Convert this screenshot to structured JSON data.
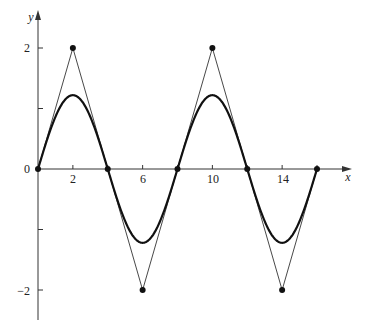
{
  "chart_data": {
    "type": "line",
    "title": "",
    "xlabel": "x",
    "ylabel": "y",
    "x_ticks": [
      2,
      6,
      10,
      14
    ],
    "x_ticks_unlabeled": [
      4,
      8,
      12,
      16
    ],
    "y_ticks": [
      2,
      0,
      -2
    ],
    "y_ticks_unlabeled": [
      1,
      -1
    ],
    "xlim": [
      0,
      18
    ],
    "ylim": [
      -2.5,
      2.5
    ],
    "grid": false,
    "legend": null,
    "series": [
      {
        "name": "triangle wave (piecewise linear)",
        "style": "thin",
        "x": [
          0,
          2,
          4,
          6,
          8,
          10,
          12,
          14,
          16
        ],
        "y": [
          0,
          2,
          0,
          -2,
          0,
          2,
          0,
          -2,
          0
        ]
      },
      {
        "name": "sine approximation",
        "style": "thick",
        "function": "A*sin(pi*x/4)",
        "amplitude": 1.22,
        "x_range": [
          0,
          16
        ]
      },
      {
        "name": "marked points",
        "style": "dots",
        "x": [
          0,
          2,
          4,
          6,
          8,
          10,
          12,
          14,
          16
        ],
        "y": [
          0,
          2,
          0,
          -2,
          0,
          2,
          0,
          -2,
          0
        ]
      }
    ]
  },
  "labels": {
    "x_axis": "x",
    "y_axis": "y",
    "origin": "0",
    "y2": "2",
    "ym2": "−2",
    "x2": "2",
    "x6": "6",
    "x10": "10",
    "x14": "14"
  }
}
